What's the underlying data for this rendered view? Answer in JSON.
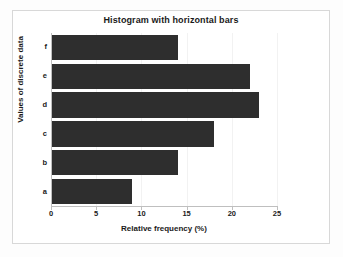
{
  "chart_data": {
    "type": "bar",
    "orientation": "horizontal",
    "title": "Histogram with horizontal bars",
    "xlabel": "Relative frequency (%)",
    "ylabel": "Values of discrete data",
    "categories": [
      "a",
      "b",
      "c",
      "d",
      "e",
      "f"
    ],
    "values": [
      9,
      14,
      18,
      23,
      22,
      14
    ],
    "xlim": [
      0,
      25
    ],
    "xticks": [
      0,
      5,
      10,
      15,
      20,
      25
    ],
    "xticklabels": [
      "0",
      "5",
      "10",
      "15",
      "20",
      "25"
    ],
    "grid": true,
    "grid_axis": "x",
    "legend": false,
    "bar_color": "#2e2e2e",
    "background_color": "#ffffff",
    "frame_color": "#d8d8d8",
    "axis_color": "#bfbfbf",
    "category_order_top_to_bottom": [
      "f",
      "e",
      "d",
      "c",
      "b",
      "a"
    ]
  }
}
